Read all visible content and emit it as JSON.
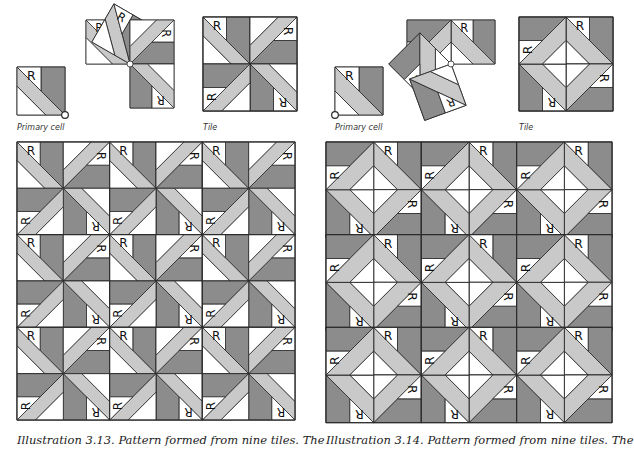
{
  "colors": {
    "dark": "#8c8c8c",
    "light": "#c9c9c9",
    "white": "#ffffff",
    "line": "#2a2a2a"
  },
  "cell_letter": "R",
  "figures": [
    {
      "id": "3.13",
      "primary_label": "Primary cell",
      "tile_label": "Tile",
      "caption": "Illustration 3.13.  Pattern formed from nine tiles. The"
    },
    {
      "id": "3.14",
      "primary_label": "Primary cell",
      "tile_label": "Tile",
      "caption": "Illustration 3.14.  Pattern formed from nine tiles. The"
    }
  ]
}
